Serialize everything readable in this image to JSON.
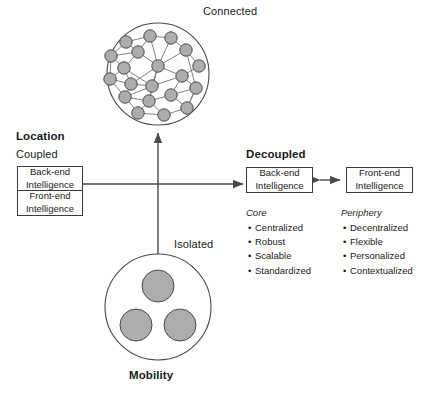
{
  "diagram": {
    "title_axis_y": "Location",
    "title_axis_x": "Mobility",
    "top_label": "Connected",
    "bottom_label": "Isolated",
    "left_state": "Coupled",
    "right_state": "Decoupled",
    "coupled_box": {
      "top_line1": "Back-end",
      "top_line2": "Intelligence",
      "bottom_line1": "Front-end",
      "bottom_line2": "Intelligence"
    },
    "decoupled_backend": {
      "line1": "Back-end",
      "line2": "Intelligence"
    },
    "decoupled_frontend": {
      "line1": "Front-end",
      "line2": "Intelligence"
    },
    "core": {
      "heading": "Core",
      "items": [
        "Centralized",
        "Robust",
        "Scalable",
        "Standardized"
      ]
    },
    "periphery": {
      "heading": "Periphery",
      "items": [
        "Decentralized",
        "Flexible",
        "Personalized",
        "Contextualized"
      ]
    },
    "bullet_glyph": "•",
    "colors": {
      "node_fill": "#adadad",
      "node_stroke": "#4a4a4a",
      "edge": "#6b6b6b",
      "circle_stroke": "#4a4a4a",
      "box_stroke": "#3a3a3a",
      "arrow": "#4a4a4a",
      "text": "#1a1a1a",
      "background": "#ffffff"
    },
    "connected_cluster": {
      "center": [
        158,
        74
      ],
      "radius": 51,
      "node_radius": 6.2,
      "nodes": [
        [
          126,
          42
        ],
        [
          150,
          36
        ],
        [
          171,
          38
        ],
        [
          111,
          56
        ],
        [
          138,
          52
        ],
        [
          186,
          50
        ],
        [
          158,
          66
        ],
        [
          124,
          68
        ],
        [
          199,
          66
        ],
        [
          110,
          79
        ],
        [
          131,
          84
        ],
        [
          152,
          86
        ],
        [
          182,
          76
        ],
        [
          125,
          97
        ],
        [
          149,
          101
        ],
        [
          171,
          95
        ],
        [
          196,
          88
        ],
        [
          138,
          113
        ],
        [
          164,
          115
        ],
        [
          187,
          108
        ]
      ],
      "edges": [
        [
          0,
          1
        ],
        [
          1,
          2
        ],
        [
          0,
          3
        ],
        [
          0,
          4
        ],
        [
          1,
          4
        ],
        [
          2,
          5
        ],
        [
          2,
          6
        ],
        [
          4,
          6
        ],
        [
          3,
          7
        ],
        [
          4,
          7
        ],
        [
          5,
          6
        ],
        [
          5,
          8
        ],
        [
          6,
          12
        ],
        [
          8,
          12
        ],
        [
          3,
          9
        ],
        [
          7,
          10
        ],
        [
          6,
          10
        ],
        [
          9,
          10
        ],
        [
          10,
          11
        ],
        [
          6,
          11
        ],
        [
          11,
          12
        ],
        [
          9,
          13
        ],
        [
          10,
          13
        ],
        [
          11,
          14
        ],
        [
          13,
          14
        ],
        [
          12,
          15
        ],
        [
          14,
          15
        ],
        [
          12,
          16
        ],
        [
          15,
          16
        ],
        [
          13,
          17
        ],
        [
          14,
          17
        ],
        [
          17,
          18
        ],
        [
          18,
          19
        ],
        [
          15,
          19
        ],
        [
          16,
          19
        ],
        [
          14,
          18
        ],
        [
          11,
          13
        ],
        [
          6,
          14
        ],
        [
          5,
          16
        ],
        [
          7,
          11
        ],
        [
          1,
          6
        ],
        [
          3,
          4
        ],
        [
          9,
          7
        ],
        [
          19,
          16
        ]
      ]
    },
    "isolated_cluster": {
      "center": [
        158,
        307
      ],
      "radius": 53,
      "dot_radius": 16,
      "dots": [
        [
          158,
          286
        ],
        [
          136,
          325
        ],
        [
          180,
          325
        ]
      ]
    }
  }
}
